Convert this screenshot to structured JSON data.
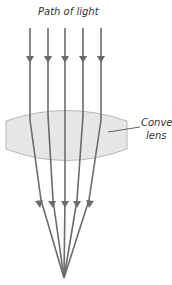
{
  "diagram": {
    "title": "Path of light",
    "lens_label_line1": "Convex",
    "lens_label_line2": "lens",
    "colors": {
      "ray": "#6b6b6b",
      "lens_fill": "#e6e6e6",
      "lens_stroke": "#b8b8b8",
      "text": "#333333"
    },
    "rays": [
      {
        "x_top": 30,
        "x_exit": 38
      },
      {
        "x_top": 48,
        "x_exit": 51
      },
      {
        "x_top": 65,
        "x_exit": 65
      },
      {
        "x_top": 83,
        "x_exit": 78
      },
      {
        "x_top": 101,
        "x_exit": 91
      }
    ],
    "focal_point": {
      "x": 64,
      "y": 278
    }
  }
}
